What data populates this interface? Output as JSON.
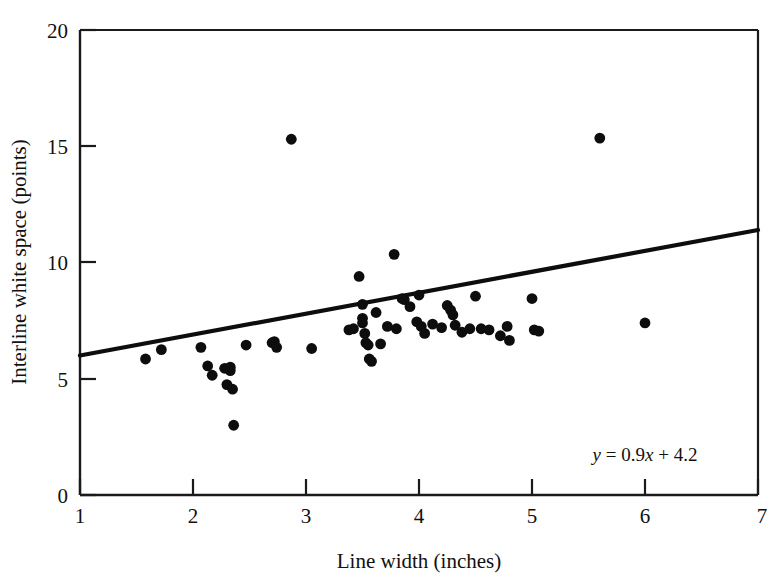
{
  "chart_data": {
    "type": "scatter",
    "title": "",
    "xlabel": "Line width (inches)",
    "ylabel": "Interline white space (points)",
    "xlim": [
      1,
      7
    ],
    "ylim": [
      0,
      20
    ],
    "xticks": [
      1,
      2,
      3,
      4,
      5,
      6,
      7
    ],
    "xtick_labels": [
      "1",
      "2",
      "3",
      "4",
      "5",
      "6",
      "7"
    ],
    "yticks": [
      0,
      5,
      10,
      15,
      20
    ],
    "ytick_labels": [
      "0",
      "5",
      "10",
      "15",
      "20"
    ],
    "grid": false,
    "legend": null,
    "annotations": [
      {
        "name": "regression-equation",
        "text": "y = 0.9x + 4.2",
        "x": 5.5,
        "y": 2.9
      }
    ],
    "series": [
      {
        "name": "Observations",
        "type": "scatter",
        "marker": "filled-circle",
        "color": "#0d0d0d",
        "points": [
          [
            1.58,
            5.85
          ],
          [
            1.72,
            6.25
          ],
          [
            2.07,
            6.35
          ],
          [
            2.13,
            5.55
          ],
          [
            2.17,
            5.15
          ],
          [
            2.28,
            5.45
          ],
          [
            2.3,
            4.75
          ],
          [
            2.33,
            5.35
          ],
          [
            2.33,
            5.5
          ],
          [
            2.35,
            4.55
          ],
          [
            2.36,
            3.0
          ],
          [
            2.47,
            6.45
          ],
          [
            2.7,
            6.55
          ],
          [
            2.72,
            6.6
          ],
          [
            2.74,
            6.35
          ],
          [
            2.87,
            15.3
          ],
          [
            3.05,
            6.3
          ],
          [
            3.38,
            7.1
          ],
          [
            3.42,
            7.15
          ],
          [
            3.47,
            9.4
          ],
          [
            3.5,
            8.2
          ],
          [
            3.5,
            7.6
          ],
          [
            3.5,
            7.4
          ],
          [
            3.52,
            6.95
          ],
          [
            3.53,
            6.55
          ],
          [
            3.55,
            6.45
          ],
          [
            3.56,
            5.85
          ],
          [
            3.58,
            5.75
          ],
          [
            3.62,
            7.85
          ],
          [
            3.66,
            6.5
          ],
          [
            3.72,
            7.25
          ],
          [
            3.78,
            10.35
          ],
          [
            3.8,
            7.15
          ],
          [
            3.85,
            8.45
          ],
          [
            3.87,
            8.4
          ],
          [
            3.92,
            8.1
          ],
          [
            3.98,
            7.45
          ],
          [
            4.0,
            8.6
          ],
          [
            4.02,
            7.25
          ],
          [
            4.05,
            6.95
          ],
          [
            4.12,
            7.35
          ],
          [
            4.2,
            7.2
          ],
          [
            4.25,
            8.15
          ],
          [
            4.28,
            7.95
          ],
          [
            4.3,
            7.75
          ],
          [
            4.32,
            7.3
          ],
          [
            4.38,
            7.0
          ],
          [
            4.45,
            7.15
          ],
          [
            4.5,
            8.55
          ],
          [
            4.55,
            7.15
          ],
          [
            4.62,
            7.1
          ],
          [
            4.72,
            6.85
          ],
          [
            4.78,
            7.25
          ],
          [
            4.8,
            6.65
          ],
          [
            5.0,
            8.45
          ],
          [
            5.02,
            7.1
          ],
          [
            5.06,
            7.05
          ],
          [
            5.6,
            15.35
          ],
          [
            6.0,
            7.4
          ]
        ]
      },
      {
        "name": "Least-squares fit",
        "type": "line",
        "color": "#0d0d0d",
        "equation": "y = 0.9x + 4.2",
        "slope": 0.9,
        "intercept": 4.2,
        "x_range": [
          1,
          7
        ],
        "y_range": [
          5.1,
          10.5
        ]
      }
    ]
  },
  "axes": {
    "x_title": "Line width (inches)",
    "y_title": "Interline white space (points)",
    "x_tick_labels": [
      "1",
      "2",
      "3",
      "4",
      "5",
      "6",
      "7"
    ],
    "y_tick_labels": [
      "0",
      "5",
      "10",
      "15",
      "20"
    ]
  },
  "equation": {
    "lhs": "y",
    "eq": " = 0.9",
    "var": "x",
    "rhs": " + 4.2",
    "full": "y = 0.9x + 4.2"
  },
  "colors": {
    "marker": "#0d0d0d",
    "line": "#0d0d0d",
    "axis": "#1a1a1a",
    "background": "#ffffff"
  }
}
